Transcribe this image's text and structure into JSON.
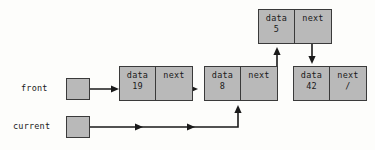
{
  "diagram": {
    "background_color": "#fdfdfb",
    "node_fill_color": "#b9b9b9",
    "stroke_color": "#1a1a1a",
    "field_labels": {
      "data": "data",
      "next": "next"
    },
    "null_symbol": "/",
    "pointers": [
      {
        "id": "front",
        "label": "front",
        "target": "node-19"
      },
      {
        "id": "current",
        "label": "current",
        "target": "node-8"
      }
    ],
    "nodes": [
      {
        "id": "node-19",
        "data_label": "data",
        "data_value": "19",
        "next_label": "next",
        "next_value": "",
        "next_target": "node-8"
      },
      {
        "id": "node-8",
        "data_label": "data",
        "data_value": "8",
        "next_label": "next",
        "next_value": "",
        "next_target": "node-5"
      },
      {
        "id": "node-5",
        "data_label": "data",
        "data_value": "5",
        "next_label": "next",
        "next_value": "",
        "next_target": "node-42"
      },
      {
        "id": "node-42",
        "data_label": "data",
        "data_value": "42",
        "next_label": "next",
        "next_value": "/",
        "next_target": null
      }
    ]
  }
}
